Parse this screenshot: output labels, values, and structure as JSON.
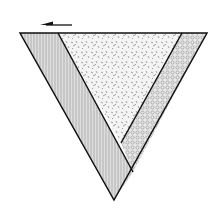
{
  "diagram": {
    "type": "inverted-triangle-layers",
    "arrow": {
      "direction": "left",
      "color": "#111111"
    },
    "regions": [
      {
        "name": "left-band",
        "pattern": "vertical-hatch",
        "fill": "#d9d9d9"
      },
      {
        "name": "center-region",
        "pattern": "stipple",
        "fill": "#f2f2f2"
      },
      {
        "name": "right-band",
        "pattern": "circles",
        "fill": "#e6e6e6"
      }
    ],
    "stroke_color": "#111111"
  }
}
